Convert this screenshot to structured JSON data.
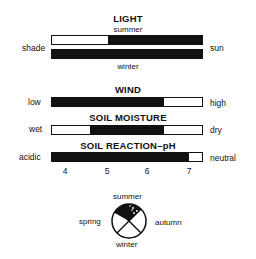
{
  "light": {
    "title": "LIGHT",
    "summer_label": "summer",
    "winter_label": "winter",
    "left_label": "shade",
    "right_label": "sun",
    "summer_range": {
      "start_pct": 0.375,
      "end_pct": 1.0
    },
    "winter_range": {
      "start_pct": 0.0,
      "end_pct": 1.0
    }
  },
  "wind": {
    "title": "WIND",
    "left_label": "low",
    "right_label": "high",
    "range": {
      "start_pct": 0.0,
      "end_pct": 0.745
    }
  },
  "soil_moisture": {
    "title": "SOIL MOISTURE",
    "left_label": "wet",
    "right_label": "dry",
    "range": {
      "start_pct": 0.25,
      "end_pct": 0.745
    }
  },
  "soil_ph": {
    "title": "SOIL REACTION–pH",
    "left_label": "acidic",
    "right_label": "neutral",
    "range_ph": [
      4.0,
      7.0
    ],
    "range": {
      "start_pct": 0.0,
      "end_pct": 0.91
    },
    "ticks": [
      "4",
      "5",
      "6",
      "7"
    ]
  },
  "seasons": {
    "summer": "summer",
    "autumn": "autumn",
    "winter": "winter",
    "spring": "spring",
    "legend_note": "filled = summer active (solid), dotted = partial"
  },
  "colors": {
    "fill": "#111111",
    "background": "#ffffff"
  }
}
